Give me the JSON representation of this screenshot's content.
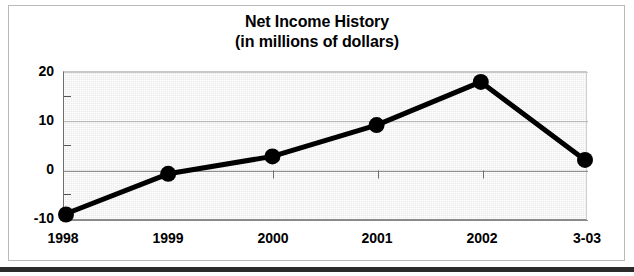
{
  "chart_data": {
    "type": "line",
    "title": "Net Income History",
    "subtitle": "(in millions of dollars)",
    "xlabel": "",
    "ylabel": "",
    "categories": [
      "1998",
      "1999",
      "2000",
      "2001",
      "2002",
      "3-03"
    ],
    "values": [
      -8.7,
      -0.5,
      3.0,
      9.3,
      18.0,
      2.3
    ],
    "series": [
      {
        "name": "Net Income",
        "values": [
          -8.7,
          -0.5,
          3.0,
          9.3,
          18.0,
          2.3
        ]
      }
    ],
    "ylim": [
      -10,
      20
    ],
    "xlim": [
      0,
      5
    ],
    "yticks": [
      20,
      10,
      0,
      -10
    ],
    "ytick_labels": [
      "20",
      "10",
      "0",
      "-10"
    ],
    "yminor_ticks": [
      15,
      5,
      -5
    ],
    "grid": true,
    "grid_axis": "y",
    "legend": false,
    "legend_position": "none",
    "marker": "circle",
    "line_color": "#000000",
    "marker_color": "#000000",
    "plot_background": "#e9e9e9",
    "zero_line": 0
  },
  "figure": {
    "background": "#ffffff",
    "frame_color": "#b9b9b9",
    "rule_color": "#2b2b2b"
  }
}
